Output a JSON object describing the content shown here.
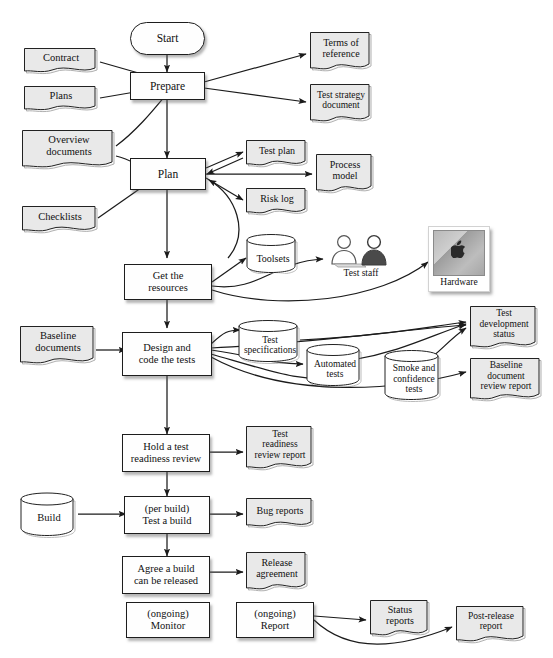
{
  "diagram": {
    "colors": {
      "document_fill": "#e9e9e9",
      "process_fill": "#fefefe",
      "line": "#1b1b1b",
      "shadow": "rgba(90,90,90,0.45)"
    }
  },
  "nodes": {
    "start": {
      "label": "Start",
      "shape": "terminator"
    },
    "prepare": {
      "label": "Prepare",
      "shape": "process"
    },
    "plan": {
      "label": "Plan",
      "shape": "process"
    },
    "get_resources": {
      "line1": "Get the",
      "line2": "resources",
      "shape": "process"
    },
    "design_code": {
      "line1": "Design and",
      "line2": "code the tests",
      "shape": "process"
    },
    "hold_review": {
      "line1": "Hold a test",
      "line2": "readiness review",
      "shape": "process"
    },
    "test_build": {
      "line1": "(per build)",
      "line2": "Test a build",
      "shape": "process"
    },
    "agree_release": {
      "line1": "Agree a build",
      "line2": "can be released",
      "shape": "process"
    },
    "monitor": {
      "line1": "(ongoing)",
      "line2": "Monitor",
      "shape": "process"
    },
    "report": {
      "line1": "(ongoing)",
      "line2": "Report",
      "shape": "process"
    },
    "contract": {
      "label": "Contract",
      "shape": "document"
    },
    "plans": {
      "label": "Plans",
      "shape": "document"
    },
    "overview_docs": {
      "line1": "Overview",
      "line2": "documents",
      "shape": "document"
    },
    "checklists": {
      "label": "Checklists",
      "shape": "document"
    },
    "baseline_docs": {
      "line1": "Baseline",
      "line2": "documents",
      "shape": "document"
    },
    "terms_ref": {
      "line1": "Terms of",
      "line2": "reference",
      "shape": "document"
    },
    "test_strategy": {
      "line1": "Test strategy",
      "line2": "document",
      "shape": "document"
    },
    "test_plan": {
      "label": "Test plan",
      "shape": "document"
    },
    "risk_log": {
      "label": "Risk log",
      "shape": "document"
    },
    "process_model": {
      "line1": "Process",
      "line2": "model",
      "shape": "document"
    },
    "test_dev_status": {
      "line1": "Test",
      "line2": "development",
      "line3": "status",
      "shape": "document"
    },
    "baseline_review": {
      "line1": "Baseline",
      "line2": "document",
      "line3": "review report",
      "shape": "document"
    },
    "readiness_report": {
      "line1": "Test",
      "line2": "readiness",
      "line3": "review report",
      "shape": "document"
    },
    "bug_reports": {
      "label": "Bug reports",
      "shape": "document"
    },
    "release_agreement": {
      "line1": "Release",
      "line2": "agreement",
      "shape": "document"
    },
    "status_reports": {
      "line1": "Status",
      "line2": "reports",
      "shape": "document"
    },
    "post_release": {
      "line1": "Post-release",
      "line2": "report",
      "shape": "document"
    },
    "toolsets": {
      "label": "Toolsets",
      "shape": "cylinder"
    },
    "test_specs": {
      "line1": "Test",
      "line2": "specifications",
      "shape": "cylinder"
    },
    "automated": {
      "line1": "Automated",
      "line2": "tests",
      "shape": "cylinder"
    },
    "smoke": {
      "line1": "Smoke and",
      "line2": "confidence",
      "line3": "tests",
      "shape": "cylinder"
    },
    "build": {
      "label": "Build",
      "shape": "cylinder"
    },
    "test_staff": {
      "label": "Test staff",
      "shape": "icon-people"
    },
    "hardware": {
      "label": "Hardware",
      "shape": "icon-computer"
    }
  },
  "edges": [
    {
      "from": "start",
      "to": "prepare"
    },
    {
      "from": "contract",
      "to": "prepare"
    },
    {
      "from": "plans",
      "to": "prepare"
    },
    {
      "from": "overview_docs",
      "to": "prepare"
    },
    {
      "from": "prepare",
      "to": "terms_ref"
    },
    {
      "from": "prepare",
      "to": "test_strategy"
    },
    {
      "from": "prepare",
      "to": "plan"
    },
    {
      "from": "overview_docs",
      "to": "plan"
    },
    {
      "from": "checklists",
      "to": "plan"
    },
    {
      "from": "plan",
      "to": "test_plan",
      "bidirectional": true
    },
    {
      "from": "plan",
      "to": "risk_log"
    },
    {
      "from": "plan",
      "to": "process_model"
    },
    {
      "from": "plan",
      "to": "get_resources"
    },
    {
      "from": "get_resources",
      "to": "plan"
    },
    {
      "from": "get_resources",
      "to": "toolsets"
    },
    {
      "from": "get_resources",
      "to": "test_staff"
    },
    {
      "from": "get_resources",
      "to": "hardware"
    },
    {
      "from": "get_resources",
      "to": "design_code"
    },
    {
      "from": "baseline_docs",
      "to": "design_code"
    },
    {
      "from": "design_code",
      "to": "test_specs"
    },
    {
      "from": "design_code",
      "to": "automated"
    },
    {
      "from": "design_code",
      "to": "smoke"
    },
    {
      "from": "design_code",
      "to": "test_dev_status"
    },
    {
      "from": "design_code",
      "to": "baseline_review"
    },
    {
      "from": "test_specs",
      "to": "test_dev_status"
    },
    {
      "from": "automated",
      "to": "test_dev_status"
    },
    {
      "from": "smoke",
      "to": "test_dev_status"
    },
    {
      "from": "design_code",
      "to": "hold_review"
    },
    {
      "from": "hold_review",
      "to": "readiness_report"
    },
    {
      "from": "hold_review",
      "to": "test_build"
    },
    {
      "from": "build",
      "to": "test_build"
    },
    {
      "from": "test_build",
      "to": "bug_reports"
    },
    {
      "from": "test_build",
      "to": "agree_release"
    },
    {
      "from": "agree_release",
      "to": "release_agreement"
    },
    {
      "from": "report",
      "to": "status_reports"
    },
    {
      "from": "report",
      "to": "post_release"
    }
  ]
}
